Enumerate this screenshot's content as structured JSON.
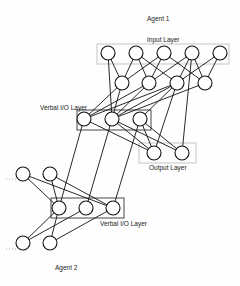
{
  "diagram": {
    "agent1": {
      "title": "Agent 1",
      "input_layer_label": "Input Layer",
      "verbal_layer_label": "Verbal I/O Layer",
      "output_layer_label": "Output Layer",
      "layers": {
        "input": {
          "count": 5
        },
        "hidden": {
          "count": 4
        },
        "verbal": {
          "count": 3
        },
        "output": {
          "count": 2
        }
      }
    },
    "agent2": {
      "title": "Agent 2",
      "verbal_layer_label": "Verbal I/O Layer",
      "layers": {
        "upper": {
          "count": 2
        },
        "verbal": {
          "count": 3
        },
        "lower": {
          "count": 2
        }
      }
    },
    "colors": {
      "stroke": "#111111",
      "layer_box": "#b8b8b8",
      "verbal_box": "#333333",
      "background": "#ffffff"
    }
  }
}
